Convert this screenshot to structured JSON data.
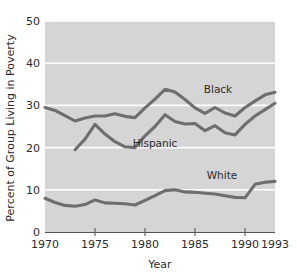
{
  "chart_data": {
    "type": "line",
    "title": "",
    "xlabel": "Year",
    "ylabel": "Percent of Group Living in Poverty",
    "xlim": [
      1970,
      1993
    ],
    "ylim": [
      0,
      50
    ],
    "grid": true,
    "grid_color": "#ffffff",
    "plot_background": "#d5d5d5",
    "line_color": "#6e6e6e",
    "legend_position": "inline-labels",
    "xticks": [
      "1970",
      "1975",
      "1980",
      "1985",
      "1990",
      "1993"
    ],
    "xtick_values": [
      1970,
      1975,
      1980,
      1985,
      1990,
      1993
    ],
    "yticks": [
      "0",
      "10",
      "20",
      "30",
      "40",
      "50"
    ],
    "ytick_values": [
      0,
      10,
      20,
      30,
      40,
      50
    ],
    "series": [
      {
        "name": "Black",
        "label": "Black",
        "color": "#6e6e6e",
        "x": [
          1970,
          1971,
          1972,
          1973,
          1974,
          1975,
          1976,
          1977,
          1978,
          1979,
          1980,
          1981,
          1982,
          1983,
          1984,
          1985,
          1986,
          1987,
          1988,
          1989,
          1990,
          1991,
          1992,
          1993
        ],
        "values": [
          29.5,
          28.8,
          27.6,
          26.3,
          27.0,
          27.5,
          27.5,
          28.0,
          27.4,
          27.1,
          29.4,
          31.5,
          33.8,
          33.2,
          31.4,
          29.4,
          28.1,
          29.5,
          28.2,
          27.5,
          29.5,
          31.0,
          32.5,
          33.1
        ]
      },
      {
        "name": "Hispanic",
        "label": "Hispanic",
        "color": "#6e6e6e",
        "x": [
          1973,
          1974,
          1975,
          1976,
          1977,
          1978,
          1979,
          1980,
          1981,
          1982,
          1983,
          1984,
          1985,
          1986,
          1987,
          1988,
          1989,
          1990,
          1991,
          1992,
          1993
        ],
        "values": [
          19.5,
          22.0,
          25.5,
          23.2,
          21.4,
          20.2,
          20.0,
          22.8,
          25.0,
          27.8,
          26.2,
          25.6,
          25.7,
          24.0,
          25.2,
          23.5,
          23.0,
          25.5,
          27.5,
          29.0,
          30.5
        ]
      },
      {
        "name": "White",
        "label": "White",
        "color": "#6e6e6e",
        "x": [
          1970,
          1971,
          1972,
          1973,
          1974,
          1975,
          1976,
          1977,
          1978,
          1979,
          1980,
          1981,
          1982,
          1983,
          1984,
          1985,
          1986,
          1987,
          1988,
          1989,
          1990,
          1991,
          1992,
          1993
        ],
        "values": [
          8.0,
          7.0,
          6.3,
          6.1,
          6.5,
          7.6,
          6.9,
          6.8,
          6.7,
          6.4,
          7.5,
          8.6,
          9.8,
          10.0,
          9.5,
          9.4,
          9.2,
          9.0,
          8.6,
          8.2,
          8.1,
          11.3,
          11.8,
          12.0
        ]
      }
    ],
    "annotations": [
      {
        "text": "Black",
        "x_px": 218,
        "y_px": 93
      },
      {
        "text": "Hispanic",
        "x_px": 155,
        "y_px": 147
      },
      {
        "text": "White",
        "x_px": 222,
        "y_px": 179
      }
    ]
  }
}
